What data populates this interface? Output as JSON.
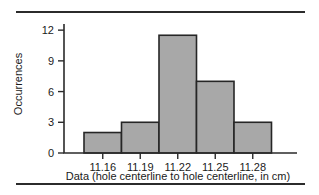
{
  "figure": {
    "top_rule": "horizontal-rule",
    "bottom_rule": "horizontal-rule"
  },
  "chart_data": {
    "type": "bar",
    "title": "",
    "xlabel": "Data (hole centerline to hole centerline, in cm)",
    "ylabel": "Occurrences",
    "categories": [
      "11.16",
      "11.19",
      "11.22",
      "11.25",
      "11.28"
    ],
    "values": [
      2,
      3,
      11.5,
      7,
      3
    ],
    "ylim": [
      0,
      12.6
    ],
    "yticks": [
      0,
      3,
      6,
      9,
      12
    ],
    "ytick_labels": [
      "0",
      "3",
      "6",
      "9",
      "12"
    ],
    "xtick_labels": [
      "11.16",
      "11.19",
      "11.22",
      "11.25",
      "11.28"
    ],
    "grid": false,
    "legend": false,
    "bar_fill": "#a8a8a8",
    "bar_edge": "#262626",
    "axis_color": "#2b2b2b"
  }
}
